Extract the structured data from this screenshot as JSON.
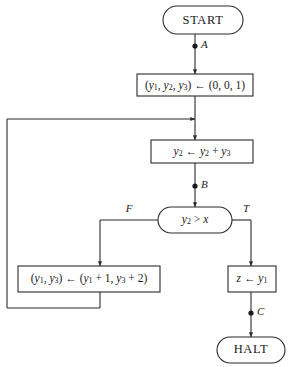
{
  "diagram": {
    "colors": {
      "stroke": "#2b2b2b",
      "text": "#1a1a1a",
      "background": "#ffffff"
    },
    "nodes": {
      "start": {
        "label": "START",
        "shape": "terminal"
      },
      "init": {
        "label": "(y1, y2, y3) ← (0, 0, 1)",
        "shape": "process"
      },
      "accumulate": {
        "label": "y2 ← y2 + y3",
        "shape": "process"
      },
      "test": {
        "label": "y2 > x",
        "shape": "decision"
      },
      "update": {
        "label": "(y1, y3) ← (y1 + 1, y3 + 2)",
        "shape": "process"
      },
      "output": {
        "label": "z ← y1",
        "shape": "process"
      },
      "halt": {
        "label": "HALT",
        "shape": "terminal"
      }
    },
    "point_labels": {
      "a": "A",
      "b": "B",
      "c": "C"
    },
    "branch_labels": {
      "false": "F",
      "true": "T"
    }
  }
}
